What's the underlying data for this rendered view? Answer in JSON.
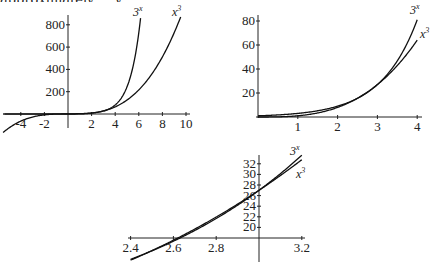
{
  "page": {
    "cutoff_text": "approximately ... y"
  },
  "chart_data": [
    {
      "type": "line",
      "title": "",
      "xlabel": "",
      "ylabel": "",
      "xlim": [
        -5.5,
        10.5
      ],
      "ylim": [
        -60,
        880
      ],
      "x_ticks": [
        -4,
        -2,
        2,
        4,
        6,
        8,
        10
      ],
      "x_tick_labels": [
        "-4",
        "-2",
        "2",
        "4",
        "6",
        "8",
        "10"
      ],
      "y_ticks": [
        200,
        400,
        600,
        800
      ],
      "y_tick_labels": [
        "200",
        "400",
        "600",
        "800"
      ],
      "grid": false,
      "series": [
        {
          "name": "3^x",
          "function": "3^x",
          "x_range": [
            -5.5,
            6.15
          ]
        },
        {
          "name": "x^3",
          "function": "x^3",
          "x_range": [
            -5.5,
            9.55
          ]
        }
      ],
      "annotations": [
        {
          "text": "3",
          "sup": "x",
          "near_series": "3^x"
        },
        {
          "text": "x",
          "sup": "3",
          "near_series": "x^3"
        }
      ],
      "pixel_frame": {
        "x0": 68,
        "y0": 114,
        "px_per_x": 11.8,
        "px_per_y": 0.1115,
        "axis_x": [
          5,
          190
        ],
        "axis_y": [
          15,
          128
        ]
      }
    },
    {
      "type": "line",
      "title": "",
      "xlabel": "",
      "ylabel": "",
      "xlim": [
        0,
        4.2
      ],
      "ylim": [
        0,
        85
      ],
      "x_ticks": [
        1,
        2,
        3,
        4
      ],
      "x_tick_labels": [
        "1",
        "2",
        "3",
        "4"
      ],
      "y_ticks": [
        20,
        40,
        60,
        80
      ],
      "y_tick_labels": [
        "20",
        "40",
        "60",
        "80"
      ],
      "grid": false,
      "series": [
        {
          "name": "3^x",
          "function": "3^x",
          "x_range": [
            0,
            4.0
          ]
        },
        {
          "name": "x^3",
          "function": "x^3",
          "x_range": [
            0,
            4.0
          ]
        }
      ],
      "annotations": [
        {
          "text": "3",
          "sup": "x",
          "near_series": "3^x"
        },
        {
          "text": "x",
          "sup": "3",
          "near_series": "x^3"
        }
      ],
      "pixel_frame": {
        "x0": 258,
        "y0": 117,
        "px_per_x": 39.8,
        "px_per_y": 1.2,
        "axis_x": [
          256,
          422
        ],
        "axis_y": [
          15,
          118
        ]
      }
    },
    {
      "type": "line",
      "title": "",
      "xlabel": "",
      "ylabel": "",
      "xlim": [
        2.38,
        3.22
      ],
      "ylim": [
        15,
        34
      ],
      "x_ticks": [
        2.4,
        2.6,
        2.8,
        3.2
      ],
      "x_tick_labels": [
        "2.4",
        "2.6",
        "2.8",
        "3.2"
      ],
      "y_ticks": [
        20,
        22,
        24,
        26,
        28,
        30,
        32
      ],
      "y_tick_labels": [
        "20",
        "22",
        "24",
        "26",
        "28",
        "30",
        "32"
      ],
      "grid": false,
      "series": [
        {
          "name": "3^x",
          "function": "3^x",
          "x_range": [
            2.4,
            3.2
          ]
        },
        {
          "name": "x^3",
          "function": "x^3",
          "x_range": [
            2.4,
            3.2
          ]
        }
      ],
      "annotations": [
        {
          "text": "3",
          "sup": "x",
          "near_series": "3^x"
        },
        {
          "text": "x",
          "sup": "3",
          "near_series": "x^3"
        }
      ],
      "pixel_frame": {
        "x0": 259,
        "x_origin_value": 3.0,
        "y_origin_value": 18,
        "y0": 238,
        "px_per_x": 214,
        "px_per_y": 5.3,
        "axis_x": [
          128,
          305
        ],
        "axis_y": [
          155,
          262
        ]
      }
    }
  ]
}
